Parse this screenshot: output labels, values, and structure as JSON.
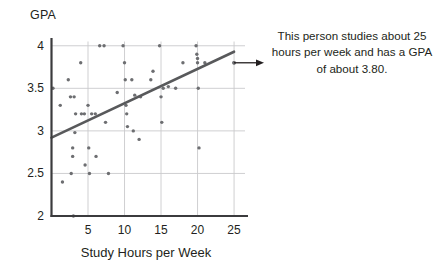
{
  "chart_data": {
    "type": "scatter",
    "title": "",
    "xlabel": "Study Hours per Week",
    "ylabel": "GPA",
    "xlim": [
      0,
      26.5
    ],
    "ylim": [
      2,
      4.05
    ],
    "xticks": [
      5,
      10,
      15,
      20,
      25
    ],
    "xtick_labels": [
      "5",
      "10",
      "15",
      "20",
      "25"
    ],
    "yticks": [
      2,
      2.5,
      3,
      3.5,
      4
    ],
    "ytick_labels": [
      "2",
      "2.5",
      "3",
      "3.5",
      "4"
    ],
    "grid": true,
    "legend": "none",
    "point_color": "#6d6e71",
    "line_color": "#58595b",
    "axis_color": "#3b3b3d",
    "grid_color": "#c9c9cc",
    "points": [
      [
        0.2,
        3.5
      ],
      [
        1.2,
        3.3
      ],
      [
        1.5,
        2.4
      ],
      [
        2.3,
        3.6
      ],
      [
        2.6,
        3.4
      ],
      [
        2.7,
        2.5
      ],
      [
        2.9,
        2.8
      ],
      [
        2.9,
        2.7
      ],
      [
        3.0,
        2.0
      ],
      [
        3.1,
        3.4
      ],
      [
        3.2,
        2.98
      ],
      [
        3.3,
        3.2
      ],
      [
        4.0,
        3.8
      ],
      [
        4.1,
        3.2
      ],
      [
        4.5,
        3.2
      ],
      [
        4.6,
        2.6
      ],
      [
        5.0,
        3.3
      ],
      [
        5.1,
        2.8
      ],
      [
        5.2,
        2.5
      ],
      [
        5.5,
        3.2
      ],
      [
        6.0,
        3.2
      ],
      [
        6.1,
        2.7
      ],
      [
        6.6,
        4.0
      ],
      [
        7.2,
        4.0
      ],
      [
        7.4,
        3.1
      ],
      [
        7.8,
        2.5
      ],
      [
        9.0,
        3.45
      ],
      [
        9.8,
        4.0
      ],
      [
        10.0,
        3.8
      ],
      [
        10.1,
        3.6
      ],
      [
        10.2,
        3.3
      ],
      [
        10.3,
        3.2
      ],
      [
        10.4,
        3.05
      ],
      [
        11.0,
        3.6
      ],
      [
        11.2,
        3.0
      ],
      [
        11.4,
        3.42
      ],
      [
        12.0,
        2.9
      ],
      [
        12.2,
        3.4
      ],
      [
        13.6,
        3.6
      ],
      [
        13.9,
        3.7
      ],
      [
        14.8,
        4.0
      ],
      [
        15.0,
        3.4
      ],
      [
        15.1,
        3.1
      ],
      [
        15.3,
        3.5
      ],
      [
        16.0,
        3.52
      ],
      [
        17.0,
        3.5
      ],
      [
        18.0,
        3.8
      ],
      [
        19.8,
        4.0
      ],
      [
        19.9,
        3.9
      ],
      [
        20.0,
        3.85
      ],
      [
        20.0,
        3.8
      ],
      [
        20.1,
        3.5
      ],
      [
        20.2,
        2.8
      ],
      [
        21.0,
        3.8
      ],
      [
        25.0,
        3.8
      ]
    ],
    "trend_line": {
      "x_start": 0,
      "y_start": 2.92,
      "x_end": 25,
      "y_end": 3.93
    },
    "highlight_point": {
      "x": 25,
      "y": 3.8
    }
  },
  "annotation": {
    "text": "This person studies about 25 hours per week and has a GPA of about 3.80.",
    "arrow": "arrow-right"
  }
}
